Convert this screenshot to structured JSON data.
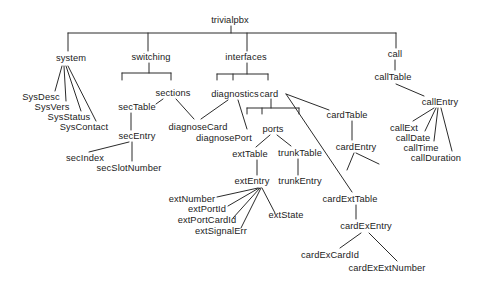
{
  "figure": {
    "title": "trivialpbx",
    "background": "#ffffff",
    "line_color": "#2b2b2b",
    "text_color": "#1b1b1b",
    "nodes": [
      {
        "id": "trivialpbx",
        "label": "trivialpbx",
        "x": 230,
        "y": 20
      },
      {
        "id": "system",
        "label": "system",
        "x": 71,
        "y": 58
      },
      {
        "id": "switching",
        "label": "switching",
        "x": 151,
        "y": 57
      },
      {
        "id": "interfaces",
        "label": "interfaces",
        "x": 246,
        "y": 57
      },
      {
        "id": "call",
        "label": "call",
        "x": 395,
        "y": 54
      },
      {
        "id": "sysDesc",
        "label": "SysDesc",
        "x": 41,
        "y": 97
      },
      {
        "id": "sysVers",
        "label": "SysVers",
        "x": 52,
        "y": 107
      },
      {
        "id": "sysStatus",
        "label": "SysStatus",
        "x": 69,
        "y": 117
      },
      {
        "id": "sysContact",
        "label": "SysContact",
        "x": 84,
        "y": 127
      },
      {
        "id": "sections",
        "label": "sections",
        "x": 173,
        "y": 93
      },
      {
        "id": "secTable",
        "label": "secTable",
        "x": 137,
        "y": 107
      },
      {
        "id": "secEntry",
        "label": "secEntry",
        "x": 137,
        "y": 136
      },
      {
        "id": "secIndex",
        "label": "secIndex",
        "x": 85,
        "y": 158
      },
      {
        "id": "secSlotNumber",
        "label": "secSlotNumber",
        "x": 129,
        "y": 168
      },
      {
        "id": "diagnostics",
        "label": "diagnostics",
        "x": 235,
        "y": 94
      },
      {
        "id": "card",
        "label": "card",
        "x": 269,
        "y": 94
      },
      {
        "id": "diagnoseCard",
        "label": "diagnoseCard",
        "x": 198,
        "y": 127
      },
      {
        "id": "diagnosePort",
        "label": "diagnosePort",
        "x": 224,
        "y": 138
      },
      {
        "id": "ports",
        "label": "ports",
        "x": 273,
        "y": 129
      },
      {
        "id": "extTable",
        "label": "extTable",
        "x": 250,
        "y": 154
      },
      {
        "id": "trunkTable",
        "label": "trunkTable",
        "x": 300,
        "y": 153
      },
      {
        "id": "extEntry",
        "label": "extEntry",
        "x": 252,
        "y": 181
      },
      {
        "id": "trunkEntry",
        "label": "trunkEntry",
        "x": 300,
        "y": 181
      },
      {
        "id": "extNumber",
        "label": "extNumber",
        "x": 192,
        "y": 199
      },
      {
        "id": "extPortId",
        "label": "extPortId",
        "x": 207,
        "y": 209
      },
      {
        "id": "extPortCardId",
        "label": "extPortCardId",
        "x": 207,
        "y": 220
      },
      {
        "id": "extSignalErr",
        "label": "extSignalErr",
        "x": 221,
        "y": 231
      },
      {
        "id": "extState",
        "label": "extState",
        "x": 286,
        "y": 215
      },
      {
        "id": "cardTable",
        "label": "cardTable",
        "x": 347,
        "y": 115
      },
      {
        "id": "cardEntry",
        "label": "cardEntry",
        "x": 356,
        "y": 147
      },
      {
        "id": "cardExtTable",
        "label": "cardExtTable",
        "x": 350,
        "y": 199
      },
      {
        "id": "cardExEntry",
        "label": "cardExEntry",
        "x": 366,
        "y": 226
      },
      {
        "id": "cardExCardId",
        "label": "cardExCardId",
        "x": 330,
        "y": 255
      },
      {
        "id": "cardExExtNumber",
        "label": "cardExExtNumber",
        "x": 387,
        "y": 268
      },
      {
        "id": "callTable",
        "label": "callTable",
        "x": 393,
        "y": 77
      },
      {
        "id": "callEntry",
        "label": "callEntry",
        "x": 440,
        "y": 102
      },
      {
        "id": "callExt",
        "label": "callExt",
        "x": 404,
        "y": 128
      },
      {
        "id": "callDate",
        "label": "callDate",
        "x": 413,
        "y": 138
      },
      {
        "id": "callTime",
        "label": "callTime",
        "x": 421,
        "y": 148
      },
      {
        "id": "callDuration",
        "label": "callDuration",
        "x": 436,
        "y": 158
      }
    ],
    "edges": [
      {
        "name": "edge-root-stub",
        "p": [
          231,
          26,
          231,
          33
        ]
      },
      {
        "name": "edge-root-bar",
        "p": [
          68,
          33,
          396,
          33
        ]
      },
      {
        "name": "edge-root-system",
        "p": [
          68,
          33,
          68,
          51
        ]
      },
      {
        "name": "edge-root-switching",
        "p": [
          148,
          33,
          148,
          51
        ]
      },
      {
        "name": "edge-root-interfaces",
        "p": [
          247,
          33,
          247,
          51
        ]
      },
      {
        "name": "edge-root-call",
        "p": [
          396,
          33,
          396,
          48
        ]
      },
      {
        "name": "edge-system-sysDesc",
        "p": [
          62,
          66,
          55,
          91
        ]
      },
      {
        "name": "edge-system-sysVers",
        "p": [
          64,
          66,
          66,
          101
        ]
      },
      {
        "name": "edge-system-sysStatus",
        "p": [
          66,
          66,
          81,
          111
        ]
      },
      {
        "name": "edge-system-sysContact",
        "p": [
          68,
          66,
          96,
          121
        ]
      },
      {
        "name": "edge-switching-stub",
        "p": [
          149,
          63,
          149,
          73
        ]
      },
      {
        "name": "edge-switching-bar",
        "p": [
          122,
          73,
          171,
          73
        ]
      },
      {
        "name": "edge-switching-tick-left",
        "p": [
          122,
          73,
          122,
          80
        ]
      },
      {
        "name": "edge-switching-tick-sections",
        "p": [
          171,
          73,
          171,
          80
        ]
      },
      {
        "name": "edge-sections-secTable",
        "p": [
          163,
          99,
          156,
          104
        ]
      },
      {
        "name": "edge-sections-diagnoseCard",
        "p": [
          176,
          99,
          194,
          119
        ]
      },
      {
        "name": "edge-secTable-secEntry",
        "p": [
          131,
          113,
          131,
          130
        ]
      },
      {
        "name": "edge-secEntry-secIndex",
        "p": [
          129,
          142,
          89,
          152
        ]
      },
      {
        "name": "edge-secEntry-secSlotNumber",
        "p": [
          132,
          142,
          132,
          161
        ]
      },
      {
        "name": "edge-interfaces-stub",
        "p": [
          247,
          63,
          247,
          74
        ]
      },
      {
        "name": "edge-interfaces-bar",
        "p": [
          217,
          74,
          268,
          74
        ]
      },
      {
        "name": "edge-interfaces-tick-left",
        "p": [
          217,
          74,
          217,
          80
        ]
      },
      {
        "name": "edge-interfaces-tick-diagnostics",
        "p": [
          233,
          74,
          233,
          80
        ]
      },
      {
        "name": "edge-interfaces-tick-card",
        "p": [
          268,
          74,
          268,
          80
        ]
      },
      {
        "name": "edge-diagnostics-diagnoseCard",
        "p": [
          228,
          100,
          201,
          119
        ]
      },
      {
        "name": "edge-diagnostics-diagnosePort",
        "p": [
          238,
          100,
          247,
          129
        ]
      },
      {
        "name": "edge-card-stub",
        "p": [
          271,
          99,
          271,
          108
        ]
      },
      {
        "name": "edge-card-bar",
        "p": [
          247,
          108,
          299,
          108
        ]
      },
      {
        "name": "edge-card-tick-left",
        "p": [
          247,
          108,
          247,
          114
        ]
      },
      {
        "name": "edge-card-tick-mid",
        "p": [
          262,
          108,
          262,
          114
        ]
      },
      {
        "name": "edge-card-tick-right",
        "p": [
          299,
          108,
          299,
          114
        ]
      },
      {
        "name": "edge-ports-extTable",
        "p": [
          270,
          135,
          256,
          147
        ]
      },
      {
        "name": "edge-ports-trunkTable",
        "p": [
          277,
          135,
          291,
          146
        ]
      },
      {
        "name": "edge-extTable-extEntry",
        "p": [
          257,
          160,
          257,
          175
        ]
      },
      {
        "name": "edge-trunkTable-trunkEntry",
        "p": [
          298,
          159,
          298,
          175
        ]
      },
      {
        "name": "edge-extEntry-extNumber",
        "p": [
          258,
          188,
          217,
          197
        ]
      },
      {
        "name": "edge-extEntry-extPortId",
        "p": [
          259,
          188,
          228,
          206
        ]
      },
      {
        "name": "edge-extEntry-extPortCardId",
        "p": [
          260,
          188,
          233,
          218
        ]
      },
      {
        "name": "edge-extEntry-extSignalErr",
        "p": [
          261,
          188,
          241,
          228
        ]
      },
      {
        "name": "edge-extEntry-extState",
        "p": [
          262,
          188,
          275,
          213
        ]
      },
      {
        "name": "edge-card-cardTable",
        "p": [
          286,
          94,
          329,
          110
        ]
      },
      {
        "name": "edge-card-cardExtTable",
        "p": [
          286,
          94,
          352,
          192
        ]
      },
      {
        "name": "edge-cardTable-cardEntry",
        "p": [
          352,
          121,
          352,
          140
        ]
      },
      {
        "name": "edge-cardEntry-fan-left",
        "p": [
          354,
          153,
          347,
          170
        ]
      },
      {
        "name": "edge-cardEntry-fan-right",
        "p": [
          356,
          153,
          379,
          164
        ]
      },
      {
        "name": "edge-cardExtTable-cardExEntry",
        "p": [
          356,
          205,
          356,
          219
        ]
      },
      {
        "name": "edge-cardExEntry-cardExCardId",
        "p": [
          361,
          233,
          340,
          248
        ]
      },
      {
        "name": "edge-cardExEntry-cardExExtNumber",
        "p": [
          369,
          233,
          397,
          261
        ]
      },
      {
        "name": "edge-call-callTable",
        "p": [
          395,
          60,
          395,
          70
        ]
      },
      {
        "name": "edge-callTable-callEntry",
        "p": [
          396,
          84,
          424,
          96
        ]
      },
      {
        "name": "edge-callEntry-callExt",
        "p": [
          434,
          108,
          413,
          121
        ]
      },
      {
        "name": "edge-callEntry-callDate",
        "p": [
          436,
          108,
          425,
          131
        ]
      },
      {
        "name": "edge-callEntry-callTime",
        "p": [
          438,
          108,
          434,
          141
        ]
      },
      {
        "name": "edge-callEntry-callDuration",
        "p": [
          441,
          108,
          452,
          151
        ]
      }
    ]
  }
}
